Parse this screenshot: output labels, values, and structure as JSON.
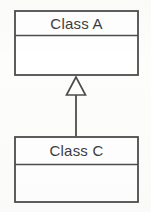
{
  "diagram": {
    "type": "uml-class-diagram",
    "title": "",
    "background_color": "#fdfdfb",
    "line_color": "#4d4d4d",
    "text_color": "#3c3c3c",
    "classes": [
      {
        "id": "class-a",
        "name": "Class A",
        "attributes": [],
        "operations": [],
        "box": {
          "x": 14,
          "y": 10,
          "width": 125,
          "height": 66
        },
        "name_divider_y": 35
      },
      {
        "id": "class-c",
        "name": "Class C",
        "attributes": [],
        "operations": [],
        "box": {
          "x": 14,
          "y": 136,
          "width": 125,
          "height": 67
        },
        "name_divider_y": 165
      }
    ],
    "relationships": [
      {
        "id": "generalization-c-to-a",
        "kind": "generalization",
        "label": "",
        "source": "Class C",
        "target": "Class A",
        "arrowhead": "hollow-triangle",
        "line_style": "solid",
        "connector_x": 76,
        "arrow_apex_y": 77,
        "arrow_base_y": 95,
        "arrow_half_width": 10,
        "line_start_y": 95,
        "line_end_y": 136
      }
    ]
  }
}
